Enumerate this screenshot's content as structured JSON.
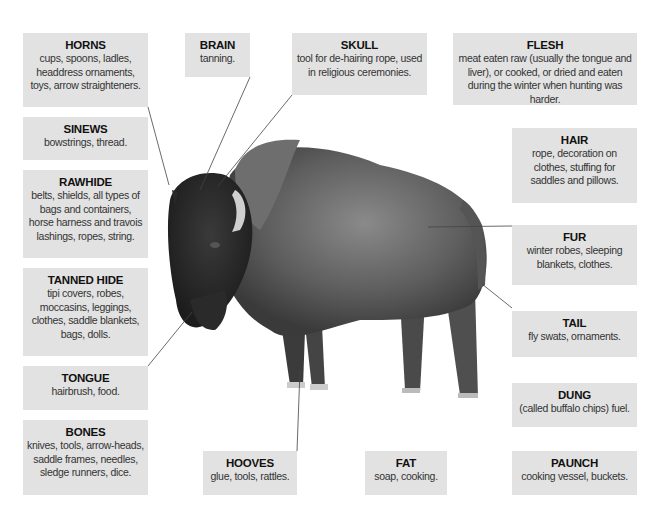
{
  "labels": {
    "horns": {
      "title": "HORNS",
      "desc": "cups, spoons, ladles, headdress ornaments, toys, arrow straighteners."
    },
    "sinews": {
      "title": "SINEWS",
      "desc": "bowstrings, thread."
    },
    "rawhide": {
      "title": "RAWHIDE",
      "desc": "belts, shields, all types of bags and containers, horse harness and travois lashings, ropes, string."
    },
    "tanned_hide": {
      "title": "TANNED HIDE",
      "desc": "tipi covers, robes, moccasins, leggings, clothes, saddle blankets, bags, dolls."
    },
    "tongue": {
      "title": "TONGUE",
      "desc": "hairbrush, food."
    },
    "bones": {
      "title": "BONES",
      "desc": "knives, tools, arrow-heads, saddle frames, needles, sledge runners, dice."
    },
    "brain": {
      "title": "BRAIN",
      "desc": "tanning."
    },
    "skull": {
      "title": "SKULL",
      "desc": "tool for de-hairing rope, used in religious ceremonies."
    },
    "flesh": {
      "title": "FLESH",
      "desc": "meat eaten raw (usually the tongue and liver), or cooked, or dried and eaten during the winter when hunting was harder."
    },
    "hair": {
      "title": "HAIR",
      "desc": "rope, decoration on clothes, stuffing for saddles and pillows."
    },
    "fur": {
      "title": "FUR",
      "desc": "winter robes, sleeping blankets, clothes."
    },
    "tail": {
      "title": "TAIL",
      "desc": "fly swats, ornaments."
    },
    "dung": {
      "title": "DUNG",
      "desc": "(called buffalo chips) fuel."
    },
    "hooves": {
      "title": "HOOVES",
      "desc": "glue, tools, rattles."
    },
    "fat": {
      "title": "FAT",
      "desc": "soap, cooking."
    },
    "paunch": {
      "title": "PAUNCH",
      "desc": "cooking vessel, buckets."
    }
  },
  "colors": {
    "box_bg": "#e2e2e2",
    "leader_line": "#444444",
    "bison_dark": "#2a2a2a",
    "bison_mid": "#6a6a6a"
  }
}
